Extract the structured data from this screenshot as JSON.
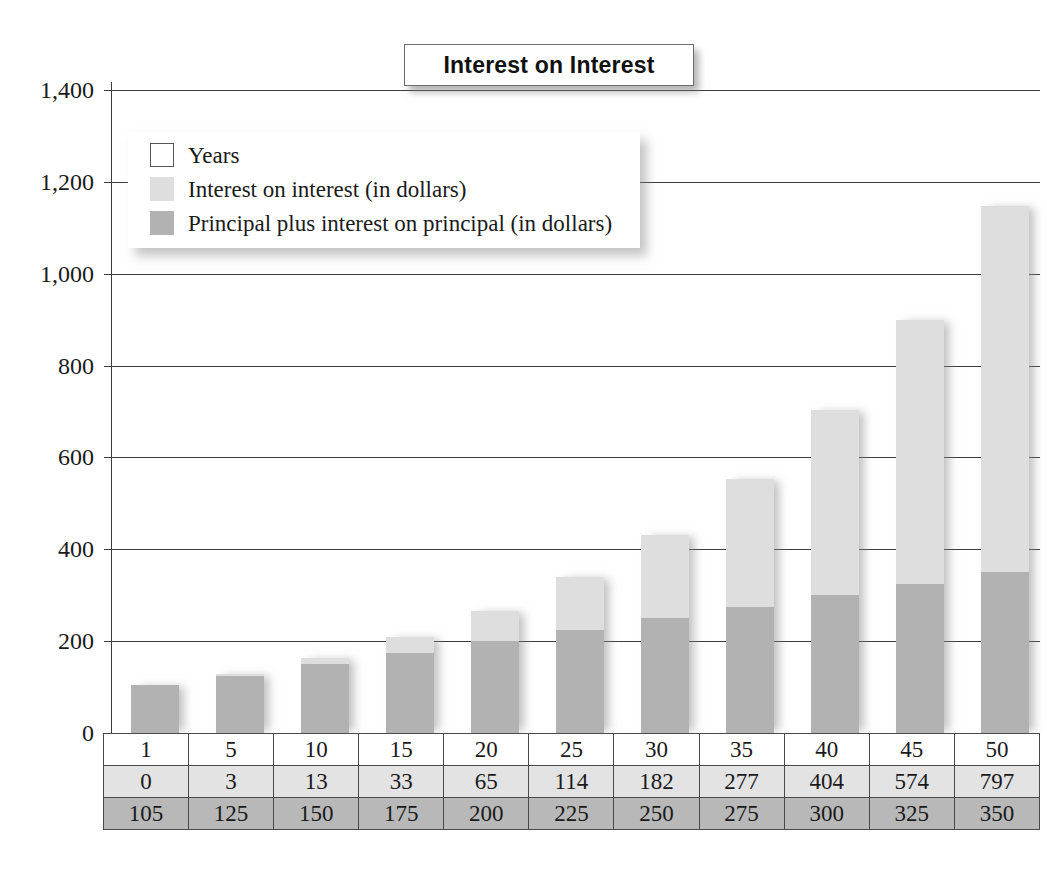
{
  "chart_data": {
    "type": "bar",
    "stacked": true,
    "title": "Interest on Interest",
    "xlabel": "",
    "ylabel": "",
    "ylim": [
      0,
      1400
    ],
    "ytick_step": 200,
    "grid": true,
    "legend_position": "top-left-inside",
    "categories": [
      "1",
      "5",
      "10",
      "15",
      "20",
      "25",
      "30",
      "35",
      "40",
      "45",
      "50"
    ],
    "ytick_labels": [
      "0",
      "200",
      "400",
      "600",
      "800",
      "1,000",
      "1,200",
      "1,400"
    ],
    "series": [
      {
        "name": "Principal plus interest on principal (in dollars)",
        "color": "#b2b2b2",
        "values": [
          105,
          125,
          150,
          175,
          200,
          225,
          250,
          275,
          300,
          325,
          350
        ]
      },
      {
        "name": "Interest on interest (in dollars)",
        "color": "#dedede",
        "values": [
          0,
          3,
          13,
          33,
          65,
          114,
          182,
          277,
          404,
          574,
          797
        ]
      }
    ],
    "totals": [
      105,
      128,
      163,
      208,
      265,
      339,
      432,
      552,
      704,
      899,
      1147
    ]
  },
  "title": {
    "text": "Interest on Interest"
  },
  "legend": {
    "items": [
      {
        "label": "Years",
        "swatch": "white-swatch"
      },
      {
        "label": "Interest on interest (in dollars)",
        "swatch": "light-gray-swatch"
      },
      {
        "label": "Principal plus interest on principal (in dollars)",
        "swatch": "medium-gray-swatch"
      }
    ]
  },
  "axis": {
    "y_ticks": [
      "1,400",
      "1,200",
      "1,000",
      "800",
      "600",
      "400",
      "200",
      "0"
    ]
  },
  "table": {
    "rows": [
      {
        "name": "years-row",
        "cells": [
          "1",
          "5",
          "10",
          "15",
          "20",
          "25",
          "30",
          "35",
          "40",
          "45",
          "50"
        ]
      },
      {
        "name": "interest-on-interest-row",
        "cells": [
          "0",
          "3",
          "13",
          "33",
          "65",
          "114",
          "182",
          "277",
          "404",
          "574",
          "797"
        ]
      },
      {
        "name": "principal-plus-interest-row",
        "cells": [
          "105",
          "125",
          "150",
          "175",
          "200",
          "225",
          "250",
          "275",
          "300",
          "325",
          "350"
        ]
      }
    ]
  },
  "colors": {
    "principal": "#b2b2b2",
    "interest": "#dedede",
    "grid": "#3d3d3d",
    "background": "#ffffff"
  }
}
